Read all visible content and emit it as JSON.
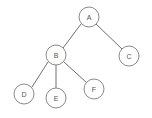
{
  "figure": {
    "kind": "binary-tree-diagram",
    "width": 152,
    "height": 118,
    "background_color": "#ffffff",
    "node_fill_color": "#ffffff",
    "node_stroke_color": "#8a8a8a",
    "edge_stroke_color": "#6e6e6e",
    "label_color": "#555555",
    "node_radius": 10
  },
  "chart_data": {
    "type": "diagram",
    "title": "",
    "nodes": [
      {
        "id": "A",
        "label": "A",
        "x": 89,
        "y": 17,
        "r": 10,
        "depth": 0
      },
      {
        "id": "B",
        "label": "B",
        "x": 56,
        "y": 55,
        "r": 10,
        "depth": 1
      },
      {
        "id": "C",
        "label": "C",
        "x": 129,
        "y": 56,
        "r": 10,
        "depth": 1
      },
      {
        "id": "D",
        "label": "D",
        "x": 24,
        "y": 94,
        "r": 10,
        "depth": 2
      },
      {
        "id": "E",
        "label": "E",
        "x": 56,
        "y": 98,
        "r": 10,
        "depth": 2
      },
      {
        "id": "F",
        "label": "F",
        "x": 94,
        "y": 89,
        "r": 10,
        "depth": 2
      }
    ],
    "edges": [
      {
        "from": "A",
        "to": "B",
        "x1": 81,
        "y1": 24,
        "x2": 63,
        "y2": 48
      },
      {
        "from": "A",
        "to": "C",
        "x1": 96,
        "y1": 24,
        "x2": 122,
        "y2": 49
      },
      {
        "from": "B",
        "to": "D",
        "x1": 48,
        "y1": 62,
        "x2": 32,
        "y2": 87
      },
      {
        "from": "B",
        "to": "E",
        "x1": 56,
        "y1": 65,
        "x2": 56,
        "y2": 88
      },
      {
        "from": "B",
        "to": "F",
        "x1": 64,
        "y1": 62,
        "x2": 87,
        "y2": 83
      }
    ]
  }
}
